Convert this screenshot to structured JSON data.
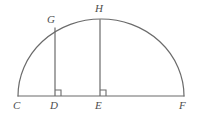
{
  "figure": {
    "background_color": "#ffffff",
    "stroke_color": "#6b6b6b",
    "label_color": "#4d4d4d",
    "stroke_width": 1.2,
    "baseline": {
      "name": "segment-CF",
      "x1": 18,
      "y1": 96,
      "x2": 184,
      "y2": 96
    },
    "arc": {
      "name": "semicircular-arc-CHF",
      "start_x": 18,
      "start_y": 96,
      "end_x": 184,
      "end_y": 96,
      "apex_x": 101,
      "apex_y": 19,
      "rx": 83,
      "ry": 77,
      "path": "M 18 96 A 83 77 0 0 1 184 96"
    },
    "segments": [
      {
        "name": "segment-GD",
        "x1": 55,
        "y1": 27.5,
        "x2": 55,
        "y2": 96
      },
      {
        "name": "segment-HE",
        "x1": 100,
        "y1": 19.2,
        "x2": 100,
        "y2": 96
      }
    ],
    "right_angle_marks": [
      {
        "name": "right-angle-mark-D",
        "path": "M 55 90 L 61 90 L 61 96",
        "vertex_x": 55,
        "vertex_y": 96
      },
      {
        "name": "right-angle-mark-E",
        "path": "M 100 90 L 106 90 L 106 96",
        "vertex_x": 100,
        "vertex_y": 96
      }
    ],
    "points": [
      {
        "name": "point-label-C",
        "label": "C",
        "x": 13,
        "y": 100
      },
      {
        "name": "point-label-D",
        "label": "D",
        "x": 50,
        "y": 100
      },
      {
        "name": "point-label-E",
        "label": "E",
        "x": 95,
        "y": 100
      },
      {
        "name": "point-label-F",
        "label": "F",
        "x": 179,
        "y": 100
      },
      {
        "name": "point-label-G",
        "label": "G",
        "x": 47,
        "y": 14
      },
      {
        "name": "point-label-H",
        "label": "H",
        "x": 95,
        "y": 3
      }
    ]
  }
}
